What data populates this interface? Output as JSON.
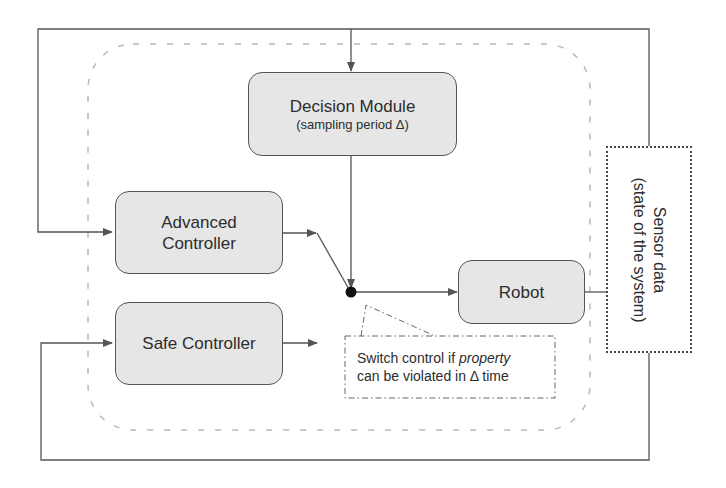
{
  "diagram": {
    "nodes": {
      "decision_module": {
        "title": "Decision Module",
        "subtitle": "(sampling period Δ)"
      },
      "advanced_controller": {
        "line1": "Advanced",
        "line2": "Controller"
      },
      "safe_controller": {
        "title": "Safe Controller"
      },
      "robot": {
        "title": "Robot"
      },
      "sensor_data": {
        "line1": "Sensor data",
        "line2": "(state of the system)"
      }
    },
    "callout": {
      "line1_prefix": "Switch control if ",
      "line1_emph": "property",
      "line2": "can be violated in Δ time"
    },
    "colors": {
      "box_fill": "#e6e6e6",
      "box_stroke": "#555555",
      "line": "#555555",
      "dashed_region": "#b5b5b5",
      "junction": "#111111"
    },
    "edges": [
      {
        "from": "sensor_data",
        "to": "decision_module",
        "label": ""
      },
      {
        "from": "sensor_data",
        "to": "advanced_controller",
        "label": ""
      },
      {
        "from": "sensor_data",
        "to": "safe_controller",
        "label": ""
      },
      {
        "from": "decision_module",
        "to": "switch_junction",
        "label": ""
      },
      {
        "from": "advanced_controller",
        "to": "switch_junction",
        "label": ""
      },
      {
        "from": "safe_controller",
        "to": "switch_junction",
        "label": ""
      },
      {
        "from": "switch_junction",
        "to": "robot",
        "label": ""
      },
      {
        "from": "robot",
        "to": "sensor_data",
        "label": ""
      }
    ]
  }
}
